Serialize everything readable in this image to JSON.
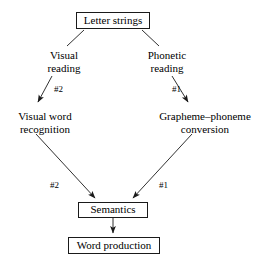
{
  "diagram": {
    "stroke_color": "#1a1a1a",
    "background_color": "#ffffff",
    "nodes": [
      {
        "id": "letter-strings",
        "label": "Letter strings",
        "boxed": true
      },
      {
        "id": "visual-reading",
        "label_line1": "Visual",
        "label_line2": "reading",
        "boxed": false
      },
      {
        "id": "phonetic-reading",
        "label_line1": "Phonetic",
        "label_line2": "reading",
        "boxed": false
      },
      {
        "id": "visual-word-recognition",
        "label_line1": "Visual word",
        "label_line2": "recognition",
        "boxed": false
      },
      {
        "id": "grapheme-phoneme-conversion",
        "label_line1": "Grapheme–phoneme",
        "label_line2": "conversion",
        "boxed": false
      },
      {
        "id": "semantics",
        "label": "Semantics",
        "boxed": true
      },
      {
        "id": "word-production",
        "label": "Word production",
        "boxed": true
      }
    ],
    "node_text": {
      "letter_strings": "Letter strings",
      "visual_reading_line1": "Visual",
      "visual_reading_line2": "reading",
      "phonetic_reading_line1": "Phonetic",
      "phonetic_reading_line2": "reading",
      "visual_word_recognition_line1": "Visual word",
      "visual_word_recognition_line2": "recognition",
      "grapheme_phoneme_line1": "Grapheme–phoneme",
      "grapheme_phoneme_line2": "conversion",
      "semantics": "Semantics",
      "word_production": "Word production"
    },
    "edge_labels": {
      "visual_reading_to_recognition": "#2",
      "phonetic_reading_to_conversion": "#1",
      "recognition_to_semantics": "#2",
      "conversion_to_semantics": "#1"
    },
    "edges": [
      {
        "id": "letter-strings-to-visual-reading",
        "from": "letter-strings",
        "to": "visual-reading",
        "arrow": false,
        "label": ""
      },
      {
        "id": "letter-strings-to-phonetic-reading",
        "from": "letter-strings",
        "to": "phonetic-reading",
        "arrow": false,
        "label": ""
      },
      {
        "id": "visual-reading-to-word-recognition",
        "from": "visual-reading",
        "to": "visual-word-recognition",
        "arrow": true,
        "label": "#2"
      },
      {
        "id": "phonetic-reading-to-grapheme-conversion",
        "from": "phonetic-reading",
        "to": "grapheme-phoneme-conversion",
        "arrow": true,
        "label": "#1"
      },
      {
        "id": "word-recognition-to-semantics",
        "from": "visual-word-recognition",
        "to": "semantics",
        "arrow": true,
        "label": "#2"
      },
      {
        "id": "grapheme-conversion-to-semantics",
        "from": "grapheme-phoneme-conversion",
        "to": "semantics",
        "arrow": true,
        "label": "#1"
      },
      {
        "id": "semantics-to-word-production",
        "from": "semantics",
        "to": "word-production",
        "arrow": true,
        "label": ""
      }
    ]
  }
}
